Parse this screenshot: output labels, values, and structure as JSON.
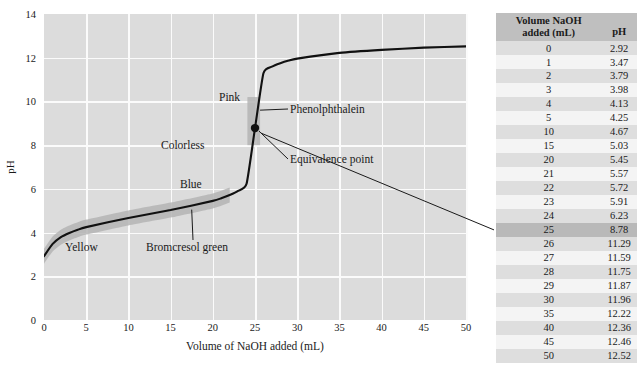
{
  "chart_data": {
    "type": "line",
    "title": "",
    "xlabel": "Volume of NaOH added (mL)",
    "ylabel": "pH",
    "xlim": [
      0,
      50
    ],
    "ylim": [
      0,
      14
    ],
    "xticks": [
      0,
      5,
      10,
      15,
      20,
      25,
      30,
      35,
      40,
      45,
      50
    ],
    "yticks": [
      0,
      2,
      4,
      6,
      8,
      10,
      12,
      14
    ],
    "grid": true,
    "legend": "none",
    "x": [
      0,
      1,
      2,
      3,
      4,
      5,
      10,
      15,
      20,
      21,
      22,
      23,
      24,
      25,
      26,
      27,
      28,
      29,
      30,
      35,
      40,
      45,
      50
    ],
    "y": [
      2.92,
      3.47,
      3.79,
      3.98,
      4.13,
      4.25,
      4.67,
      5.03,
      5.45,
      5.57,
      5.72,
      5.91,
      6.23,
      8.78,
      11.29,
      11.59,
      11.75,
      11.87,
      11.96,
      12.22,
      12.36,
      12.46,
      12.52
    ],
    "equivalence_point": {
      "x": 25,
      "y": 8.78,
      "label": "Equivalence point"
    },
    "annotations": [
      {
        "name": "pink-label",
        "text": "Pink"
      },
      {
        "name": "colorless-label",
        "text": "Colorless"
      },
      {
        "name": "phenolphthalein-label",
        "text": "Phenolphthalein"
      },
      {
        "name": "equivalence-point-label",
        "text": "Equivalence point"
      },
      {
        "name": "blue-label",
        "text": "Blue"
      },
      {
        "name": "yellow-label",
        "text": "Yellow"
      },
      {
        "name": "bromcresol-green-label",
        "text": "Bromcresol green"
      }
    ],
    "indicators": [
      {
        "name": "phenolphthalein",
        "range_ph": [
          8.0,
          10.0
        ],
        "colors": [
          "Colorless",
          "Pink"
        ]
      },
      {
        "name": "bromcresol green",
        "range_ph": [
          3.8,
          5.4
        ],
        "colors": [
          "Yellow",
          "Blue"
        ]
      }
    ]
  },
  "chart": {
    "axis": {
      "ylabel": "pH",
      "xlabel": "Volume of NaOH added (mL)",
      "yticks": [
        "0",
        "2",
        "4",
        "6",
        "8",
        "10",
        "12",
        "14"
      ],
      "xticks": [
        "0",
        "5",
        "10",
        "15",
        "20",
        "25",
        "30",
        "35",
        "40",
        "45",
        "50"
      ]
    },
    "labels": {
      "pink": "Pink",
      "colorless": "Colorless",
      "phenolphthalein": "Phenolphthalein",
      "equivalence_point": "Equivalence point",
      "blue": "Blue",
      "yellow": "Yellow",
      "bromcresol_green": "Bromcresol green"
    },
    "colors": {
      "plot_background": "#dcdcdc",
      "gridline": "#fbfbfb",
      "curve": "#111111",
      "indicator_band": "#b2b2b2"
    }
  },
  "table": {
    "headers": {
      "volume_line1": "Volume NaOH",
      "volume_line2": "added (mL)",
      "ph": "pH"
    },
    "highlight_row_index": 13,
    "rows": [
      {
        "volume": "0",
        "ph": "2.92"
      },
      {
        "volume": "1",
        "ph": "3.47"
      },
      {
        "volume": "2",
        "ph": "3.79"
      },
      {
        "volume": "3",
        "ph": "3.98"
      },
      {
        "volume": "4",
        "ph": "4.13"
      },
      {
        "volume": "5",
        "ph": "4.25"
      },
      {
        "volume": "10",
        "ph": "4.67"
      },
      {
        "volume": "15",
        "ph": "5.03"
      },
      {
        "volume": "20",
        "ph": "5.45"
      },
      {
        "volume": "21",
        "ph": "5.57"
      },
      {
        "volume": "22",
        "ph": "5.72"
      },
      {
        "volume": "23",
        "ph": "5.91"
      },
      {
        "volume": "24",
        "ph": "6.23"
      },
      {
        "volume": "25",
        "ph": "8.78"
      },
      {
        "volume": "26",
        "ph": "11.29"
      },
      {
        "volume": "27",
        "ph": "11.59"
      },
      {
        "volume": "28",
        "ph": "11.75"
      },
      {
        "volume": "29",
        "ph": "11.87"
      },
      {
        "volume": "30",
        "ph": "11.96"
      },
      {
        "volume": "35",
        "ph": "12.22"
      },
      {
        "volume": "40",
        "ph": "12.36"
      },
      {
        "volume": "45",
        "ph": "12.46"
      },
      {
        "volume": "50",
        "ph": "12.52"
      }
    ]
  }
}
